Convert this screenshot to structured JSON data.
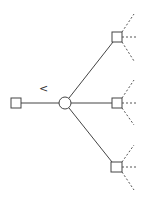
{
  "diagram": {
    "type": "tree",
    "label_arrow": "<",
    "root": {
      "shape": "square",
      "id": "root"
    },
    "hub": {
      "shape": "circle",
      "id": "hub"
    },
    "children": [
      {
        "shape": "square",
        "id": "child-top",
        "branches": "dashed"
      },
      {
        "shape": "square",
        "id": "child-middle",
        "branches": "dashed"
      },
      {
        "shape": "square",
        "id": "child-bottom",
        "branches": "dashed"
      }
    ],
    "stroke_color": "#444444"
  }
}
